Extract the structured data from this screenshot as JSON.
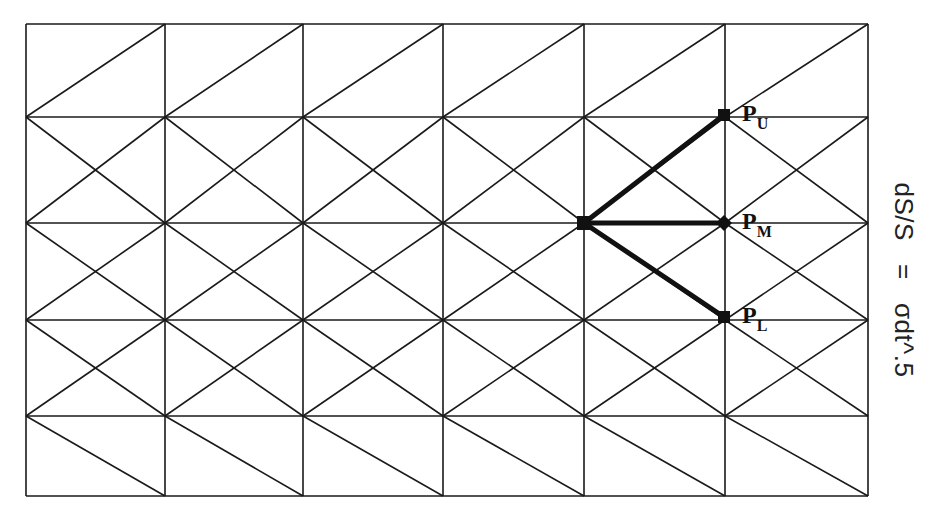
{
  "diagram": {
    "grid": {
      "columns_x": [
        26,
        165,
        303,
        443,
        584,
        725,
        868
      ],
      "rows_y": [
        24,
        117,
        223,
        320,
        416,
        496
      ],
      "line_color": "#1a1a1a"
    },
    "branch_origin": {
      "x": 584,
      "y": 223
    },
    "nodes": [
      {
        "id": "PU",
        "label": "P",
        "sub": "U",
        "x": 724,
        "y": 115
      },
      {
        "id": "PM",
        "label": "P",
        "sub": "M",
        "x": 724,
        "y": 223
      },
      {
        "id": "PL",
        "label": "P",
        "sub": "L",
        "x": 724,
        "y": 317
      }
    ],
    "formula": "dS/S   =   σdt^.5"
  }
}
